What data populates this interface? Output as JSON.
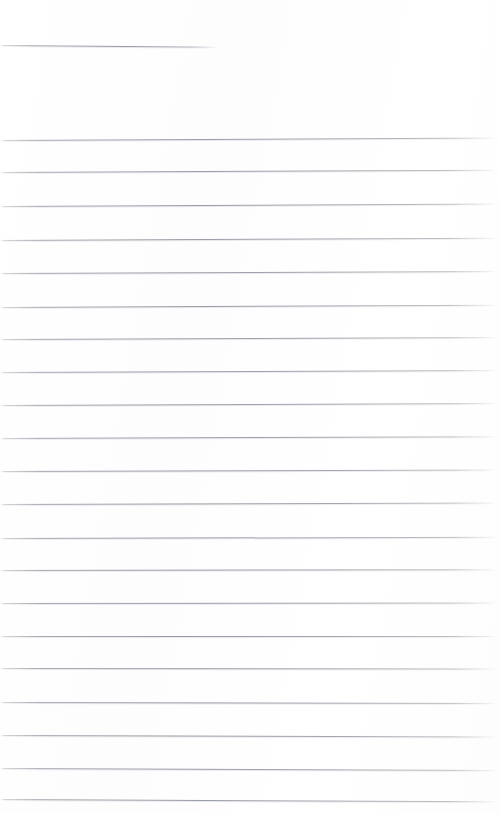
{
  "page": {
    "kind": "scanned-lined-notepaper",
    "width": 500,
    "height": 813,
    "background_color": "#ffffff",
    "rule_color": "#9ca0a9",
    "content_text": ""
  },
  "rules": [
    {
      "name": "partial-rule-top",
      "type": "short",
      "y": 45,
      "x": 0,
      "length": 220,
      "slant_deg": 0.45
    },
    {
      "name": "rule-1",
      "type": "full",
      "y": 140,
      "x": 0,
      "length": 497,
      "slant_deg": -0.28
    },
    {
      "name": "rule-2",
      "type": "full",
      "y": 172,
      "x": 0,
      "length": 497,
      "slant_deg": -0.26
    },
    {
      "name": "rule-3",
      "type": "full",
      "y": 206,
      "x": 0,
      "length": 497,
      "slant_deg": -0.3
    },
    {
      "name": "rule-4",
      "type": "full",
      "y": 240,
      "x": 0,
      "length": 497,
      "slant_deg": -0.26
    },
    {
      "name": "rule-5",
      "type": "full",
      "y": 273,
      "x": 0,
      "length": 497,
      "slant_deg": -0.24
    },
    {
      "name": "rule-6",
      "type": "full",
      "y": 307,
      "x": 0,
      "length": 497,
      "slant_deg": -0.26
    },
    {
      "name": "rule-7",
      "type": "full",
      "y": 339,
      "x": 0,
      "length": 497,
      "slant_deg": -0.22
    },
    {
      "name": "rule-8",
      "type": "full",
      "y": 372,
      "x": 0,
      "length": 497,
      "slant_deg": -0.24
    },
    {
      "name": "rule-9",
      "type": "full",
      "y": 405,
      "x": 0,
      "length": 497,
      "slant_deg": -0.22
    },
    {
      "name": "rule-10",
      "type": "full",
      "y": 438,
      "x": 0,
      "length": 497,
      "slant_deg": -0.2
    },
    {
      "name": "rule-11",
      "type": "full",
      "y": 471,
      "x": 0,
      "length": 497,
      "slant_deg": -0.18
    },
    {
      "name": "rule-12",
      "type": "full",
      "y": 504,
      "x": 0,
      "length": 497,
      "slant_deg": -0.16
    },
    {
      "name": "rule-13",
      "type": "full",
      "y": 538,
      "x": 0,
      "length": 497,
      "slant_deg": -0.14
    },
    {
      "name": "rule-14",
      "type": "full",
      "y": 570,
      "x": 0,
      "length": 497,
      "slant_deg": -0.1
    },
    {
      "name": "rule-15",
      "type": "full",
      "y": 603,
      "x": 0,
      "length": 497,
      "slant_deg": -0.06
    },
    {
      "name": "rule-16",
      "type": "full",
      "y": 636,
      "x": 0,
      "length": 497,
      "slant_deg": 0.0
    },
    {
      "name": "rule-17",
      "type": "full",
      "y": 668,
      "x": 0,
      "length": 497,
      "slant_deg": 0.06
    },
    {
      "name": "rule-18",
      "type": "full",
      "y": 702,
      "x": 0,
      "length": 497,
      "slant_deg": 0.12
    },
    {
      "name": "rule-19",
      "type": "full",
      "y": 735,
      "x": 0,
      "length": 497,
      "slant_deg": 0.16
    },
    {
      "name": "rule-20",
      "type": "full",
      "y": 768,
      "x": 0,
      "length": 497,
      "slant_deg": 0.22
    },
    {
      "name": "rule-21",
      "type": "full",
      "y": 799,
      "x": 0,
      "length": 497,
      "slant_deg": 0.26
    }
  ]
}
